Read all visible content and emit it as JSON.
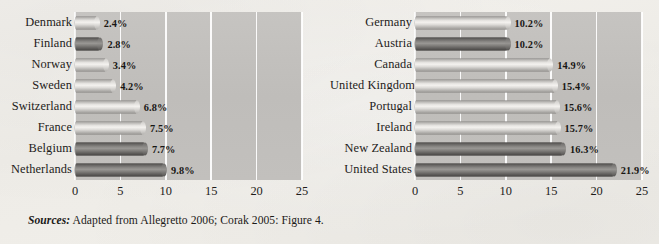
{
  "figure": {
    "source_note_lead": "Sources:",
    "source_note_text": " Adapted from Allegretto 2006; Corak 2005: Figure 4."
  },
  "chart_data": [
    {
      "type": "bar",
      "orientation": "horizontal",
      "panel": "left",
      "title": "",
      "xlabel": "",
      "ylabel": "",
      "xlim": [
        0,
        25
      ],
      "xticks": [
        0,
        5,
        10,
        15,
        20,
        25
      ],
      "xticklabels": [
        "0",
        "5",
        "10",
        "15",
        "20",
        "25"
      ],
      "grid": true,
      "legend": "none",
      "categories": [
        "Denmark",
        "Finland",
        "Norway",
        "Sweden",
        "Switzerland",
        "France",
        "Belgium",
        "Netherlands"
      ],
      "values": [
        2.4,
        2.8,
        3.4,
        4.2,
        6.8,
        7.5,
        7.7,
        9.8
      ],
      "value_labels": [
        "2.4%",
        "2.8%",
        "3.4%",
        "4.2%",
        "6.8%",
        "7.5%",
        "7.7%",
        "9.8%"
      ],
      "bar_shades": [
        "light",
        "dark",
        "light",
        "light",
        "light",
        "light",
        "dark",
        "dark"
      ]
    },
    {
      "type": "bar",
      "orientation": "horizontal",
      "panel": "right",
      "title": "",
      "xlabel": "",
      "ylabel": "",
      "xlim": [
        0,
        25
      ],
      "xticks": [
        0,
        5,
        10,
        15,
        20,
        25
      ],
      "xticklabels": [
        "0",
        "5",
        "10",
        "15",
        "20",
        "25"
      ],
      "grid": true,
      "legend": "none",
      "categories": [
        "Germany",
        "Austria",
        "Canada",
        "United Kingdom",
        "Portugal",
        "Ireland",
        "New Zealand",
        "United States"
      ],
      "values": [
        10.2,
        10.2,
        14.9,
        15.4,
        15.6,
        15.7,
        16.3,
        21.9
      ],
      "value_labels": [
        "10.2%",
        "10.2%",
        "14.9%",
        "15.4%",
        "15.6%",
        "15.7%",
        "16.3%",
        "21.9%"
      ],
      "bar_shades": [
        "light",
        "dark",
        "light",
        "light",
        "light",
        "light",
        "dark",
        "dark"
      ]
    }
  ],
  "colors": {
    "page_background": "#f2f0ec",
    "plot_background": "#c2c0bd",
    "gridline": "#ffffff",
    "bar_light": "#dedcd9",
    "bar_dark": "#6a6866",
    "text": "#1e1c1a"
  }
}
